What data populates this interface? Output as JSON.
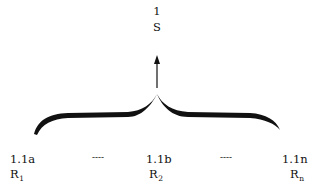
{
  "top_node": {
    "number": "1",
    "label": "S"
  },
  "bottom_nodes": [
    {
      "code": "1.1a",
      "label": "R",
      "subscript": "1"
    },
    {
      "code": "1.1b",
      "label": "R",
      "subscript": "2"
    },
    {
      "code": "1.1n",
      "label": "R",
      "subscript": "n"
    }
  ],
  "ellipses": [
    "----",
    "----"
  ],
  "colors": {
    "ink": "#111111",
    "background": "#ffffff"
  }
}
